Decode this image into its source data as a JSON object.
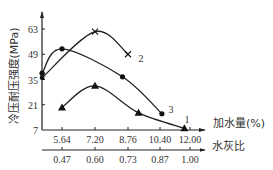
{
  "chart_data": {
    "type": "line",
    "title": "",
    "ylabel": "冷压耐压强度(MPa)",
    "xlabel": "加水量(%)",
    "xlabel2": "水灰比",
    "yticks": [
      7,
      21,
      35,
      49,
      63
    ],
    "ylim": [
      7,
      70
    ],
    "xticks": [
      5.64,
      7.2,
      8.76,
      10.4,
      12.0
    ],
    "xticks_labels": [
      "5.64",
      "7.20",
      "8.76",
      "10.40",
      "12.00"
    ],
    "x2ticks_labels": [
      "0.47",
      "0.60",
      "0.73",
      "0.87",
      "1.00"
    ],
    "grid": false,
    "legend": "inline numeric labels",
    "series": [
      {
        "name": "1",
        "marker": "triangle",
        "points": [
          [
            5.64,
            19.5
          ],
          [
            7.2,
            31.5
          ],
          [
            9.3,
            16.5
          ],
          [
            11.7,
            8.0
          ]
        ],
        "label_pos": [
          11.7,
          11.0
        ]
      },
      {
        "name": "2",
        "marker": "x",
        "points": [
          [
            4.7,
            36.0
          ],
          [
            7.2,
            61.5
          ],
          [
            8.76,
            49.0
          ]
        ],
        "label_pos": [
          9.3,
          44.5
        ]
      },
      {
        "name": "3",
        "marker": "dot",
        "points": [
          [
            4.7,
            38.5
          ],
          [
            5.64,
            52.0
          ],
          [
            8.5,
            36.5
          ],
          [
            10.5,
            16.0
          ]
        ],
        "label_pos": [
          10.85,
          16.5
        ]
      }
    ]
  },
  "labels": {
    "y_axis_title": "冷压耐压强度(MPa)",
    "x_axis_title": "加水量(%)",
    "x2_axis_title": "水灰比"
  }
}
